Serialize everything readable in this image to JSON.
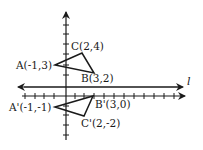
{
  "diagram": {
    "axes": {
      "x_axis": {
        "min": -4,
        "max": 11
      },
      "y_axis": {
        "min": -4,
        "max": 8
      }
    },
    "line_label": "l",
    "original_triangle": {
      "vertices": [
        {
          "name": "A",
          "label": "A(-1,3)",
          "x": -1,
          "y": 3
        },
        {
          "name": "B",
          "label": "B(3,2)",
          "x": 3,
          "y": 2
        },
        {
          "name": "C",
          "label": "C(2,4)",
          "x": 2,
          "y": 4
        }
      ]
    },
    "image_triangle": {
      "vertices": [
        {
          "name": "A'",
          "label": "A'(-1,-1)",
          "x": -1,
          "y": -1
        },
        {
          "name": "B'",
          "label": "B'(3,0)",
          "x": 3,
          "y": 0
        },
        {
          "name": "C'",
          "label": "C'(2,-2)",
          "x": 2,
          "y": -2
        }
      ]
    },
    "colors": {
      "stroke": "#1a1a1a",
      "background": "#ffffff"
    }
  }
}
